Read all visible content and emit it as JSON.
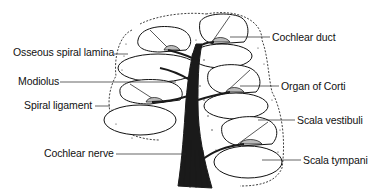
{
  "diagram": {
    "colors": {
      "ink": "#111111",
      "background": "#ffffff",
      "nerve": "#1a1a1a"
    },
    "labels_left": [
      {
        "id": "osseous-spiral-lamina",
        "text": "Osseous spiral lamina"
      },
      {
        "id": "modiolus",
        "text": "Modiolus"
      },
      {
        "id": "spiral-ligament",
        "text": "Spiral ligament"
      },
      {
        "id": "cochlear-nerve",
        "text": "Cochlear nerve"
      }
    ],
    "labels_right": [
      {
        "id": "cochlear-duct",
        "text": "Cochlear duct"
      },
      {
        "id": "organ-of-corti",
        "text": "Organ of Corti"
      },
      {
        "id": "scala-vestibuli",
        "text": "Scala vestibuli"
      },
      {
        "id": "scala-tympani",
        "text": "Scala tympani"
      }
    ]
  }
}
